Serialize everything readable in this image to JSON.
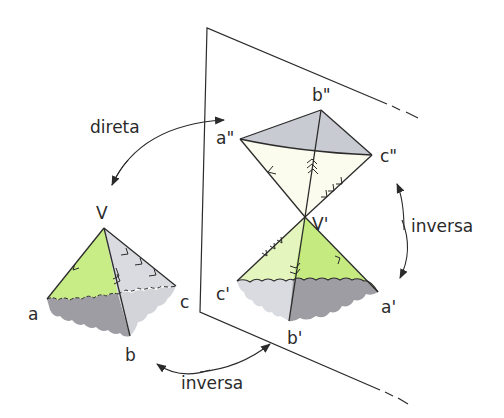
{
  "colors": {
    "line": "#2b2b2b",
    "green_light": "#e9f7c8",
    "green": "#c8ec86",
    "green_dark": "#b6e16a",
    "gray_light": "#d9dbe0",
    "gray_mid": "#c9cbd2",
    "gray_dark": "#9d9da3",
    "cream": "#fbfbee"
  },
  "labels": {
    "direta": "direta",
    "inversa_right": "inversa",
    "inversa_bottom": "inversa",
    "V": "V",
    "a": "a",
    "b": "b",
    "c": "c",
    "V_prime": "V'",
    "a_prime": "a'",
    "b_prime": "b'",
    "c_prime": "c'",
    "a_double": "a\"",
    "b_double": "b\"",
    "c_double": "c\""
  }
}
